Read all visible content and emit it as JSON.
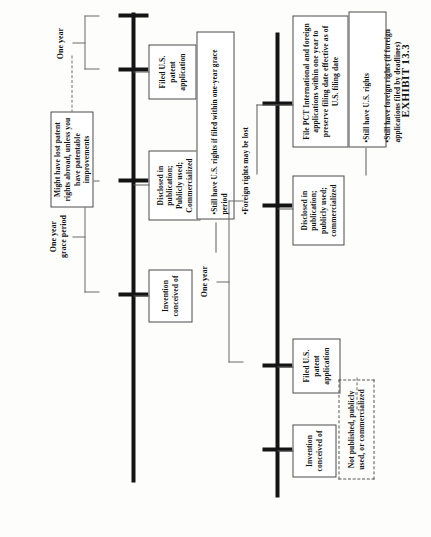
{
  "exhibit": {
    "caption": "EXHIBIT 13.3"
  },
  "timelines": [
    {
      "id": "upper",
      "name": "no-us-filing-timeline",
      "events": [
        {
          "key": "invention",
          "label": "Invention\nconceived of"
        },
        {
          "key": "disclosure",
          "label": "Disclosed in\npublication;\nPublicly used;\nCommercialized"
        },
        {
          "key": "filing",
          "label": "Filed U.S.\npatent\napplication"
        }
      ],
      "spans": [
        {
          "key": "grace",
          "label": "One year\ngrace period"
        },
        {
          "key": "year",
          "label": "One year"
        }
      ],
      "notes": [
        {
          "key": "abroad-risk",
          "label": "Might have lost patent rights abroad, unless you have patentable improvements"
        },
        {
          "key": "us-rights",
          "bullets": [
            "•Still have U.S. rights if filed within one-year grace period",
            "•Foreign rights may be lost"
          ]
        }
      ]
    },
    {
      "id": "lower",
      "name": "us-filing-first-timeline",
      "events": [
        {
          "key": "invention",
          "label": "Invention\nconceived of"
        },
        {
          "key": "filing",
          "label": "Filed U.S.\npatent\napplication"
        },
        {
          "key": "disclosure",
          "label": "Disclosed in\npublication;\npublicly used;\ncommercialized"
        },
        {
          "key": "pct",
          "label": "File PCT International and foreign applications within one year to preserve filing date effective as of U.S. filing date"
        }
      ],
      "spans": [
        {
          "key": "year",
          "label": "One year"
        }
      ],
      "notes": [
        {
          "key": "secrecy",
          "label": "Not published, publicly used, or commercialized"
        },
        {
          "key": "rights-ok",
          "bullets": [
            "•Still have U.S. rights",
            "•Still have foreign rights (if foreign applications filed by deadlines)"
          ]
        }
      ]
    }
  ],
  "colors": {
    "ink": "#141414",
    "rule": "#5a5a5a",
    "paper": "#fdfdfc"
  }
}
